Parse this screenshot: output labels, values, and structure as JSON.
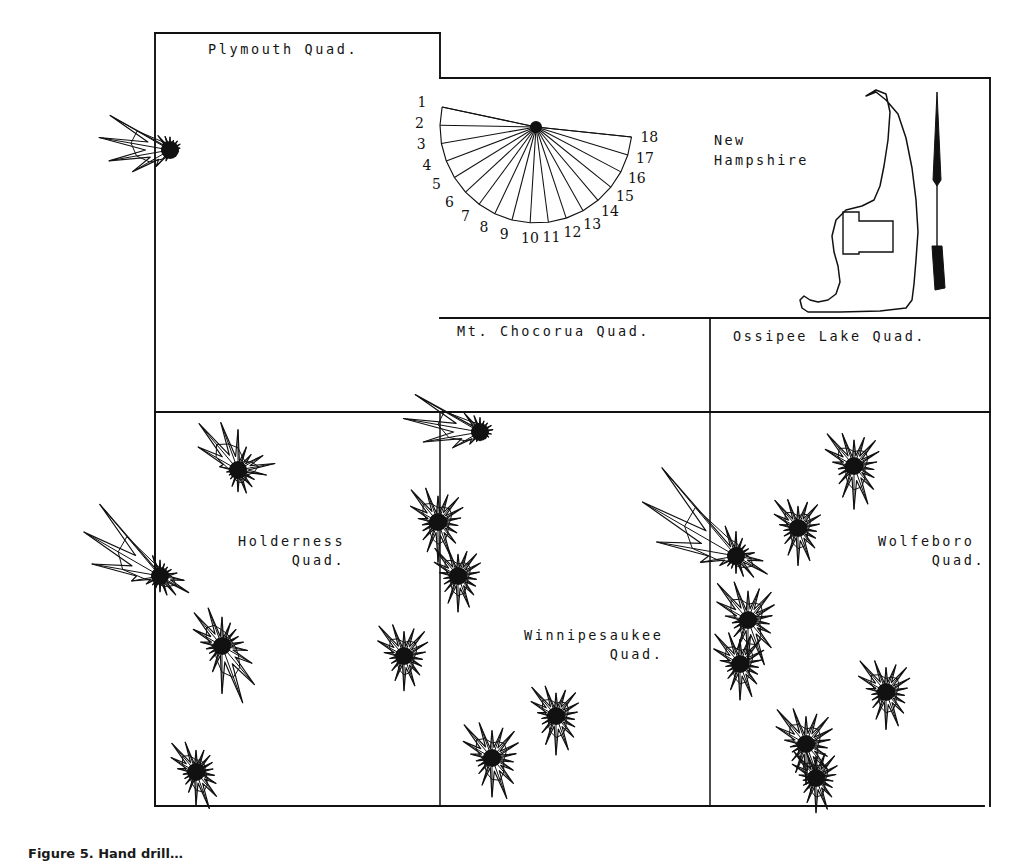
{
  "figure": {
    "caption": "Figure 5.  Hand drill…",
    "background": "#ffffff",
    "ink": "#111111"
  },
  "inset": {
    "title_line1": "New",
    "title_line2": "Hampshire",
    "state_name": "New Hampshire",
    "study_area_box": "rectangular outline inside state",
    "north_arrow": "north-arrow"
  },
  "legend": {
    "ray_labels": [
      "1",
      "2",
      "3",
      "4",
      "5",
      "6",
      "7",
      "8",
      "9",
      "10",
      "11",
      "12",
      "13",
      "14",
      "15",
      "16",
      "17",
      "18"
    ],
    "ray_count": 18
  },
  "quads": [
    {
      "id": "plymouth",
      "label_lines": [
        "Plymouth Quad."
      ]
    },
    {
      "id": "mt-chocorua",
      "label_lines": [
        "Mt. Chocorua Quad."
      ]
    },
    {
      "id": "ossipee-lake",
      "label_lines": [
        "Ossipee Lake Quad."
      ]
    },
    {
      "id": "holderness",
      "label_lines": [
        "Holderness",
        "     Quad."
      ]
    },
    {
      "id": "winnipesaukee",
      "label_lines": [
        "Winnipesaukee",
        "        Quad."
      ]
    },
    {
      "id": "wolfeboro",
      "label_lines": [
        "Wolfeboro",
        "     Quad."
      ]
    }
  ],
  "chart_data": {
    "type": "rose",
    "ray_count": 18,
    "ray_labels": [
      "1",
      "2",
      "3",
      "4",
      "5",
      "6",
      "7",
      "8",
      "9",
      "10",
      "11",
      "12",
      "13",
      "14",
      "15",
      "16",
      "17",
      "18"
    ],
    "legend_rose": {
      "cx": 536,
      "cy": 127,
      "start_deg": 168,
      "sweep_deg": 186,
      "radius": 96,
      "values": [
        96,
        96,
        96,
        96,
        96,
        96,
        96,
        96,
        96,
        96,
        96,
        96,
        96,
        96,
        96,
        96,
        96,
        96
      ]
    },
    "roses": [
      {
        "id": "r1",
        "quad": "plymouth",
        "cx": 170,
        "cy": 150,
        "scale": 1.0,
        "values": [
          18,
          20,
          26,
          96,
          100,
          86,
          60,
          30,
          16,
          10,
          8,
          8,
          10,
          12,
          14,
          16,
          16,
          14
        ]
      },
      {
        "id": "r2",
        "quad": "holderness",
        "cx": 238,
        "cy": 470,
        "scale": 1.0,
        "values": [
          56,
          70,
          84,
          64,
          26,
          16,
          14,
          16,
          24,
          30,
          34,
          30,
          26,
          40,
          52,
          40,
          28,
          34
        ]
      },
      {
        "id": "r3",
        "quad": "holderness",
        "cx": 160,
        "cy": 576,
        "scale": 1.0,
        "values": [
          22,
          30,
          130,
          122,
          96,
          40,
          22,
          16,
          18,
          22,
          28,
          34,
          46,
          34,
          24,
          18,
          16,
          18
        ]
      },
      {
        "id": "r4",
        "quad": "holderness",
        "cx": 222,
        "cy": 646,
        "scale": 1.0,
        "values": [
          40,
          56,
          60,
          46,
          30,
          22,
          20,
          26,
          38,
          66,
          84,
          70,
          48,
          36,
          30,
          26,
          30,
          34
        ]
      },
      {
        "id": "r5",
        "quad": "holderness",
        "cx": 196,
        "cy": 772,
        "scale": 1.0,
        "values": [
          30,
          44,
          52,
          40,
          26,
          18,
          18,
          22,
          30,
          46,
          54,
          44,
          32,
          26,
          24,
          26,
          30,
          32
        ]
      },
      {
        "id": "r6",
        "quad": "mt-chocorua",
        "cx": 480,
        "cy": 432,
        "scale": 1.0,
        "values": [
          20,
          24,
          34,
          104,
          108,
          80,
          44,
          22,
          14,
          12,
          10,
          12,
          14,
          16,
          18,
          18,
          16,
          16
        ]
      },
      {
        "id": "r7",
        "quad": "mt-chocorua",
        "cx": 438,
        "cy": 522,
        "scale": 1.0,
        "values": [
          36,
          50,
          58,
          44,
          28,
          22,
          24,
          32,
          44,
          56,
          50,
          38,
          30,
          28,
          32,
          40,
          44,
          40
        ]
      },
      {
        "id": "r8",
        "quad": "mt-chocorua",
        "cx": 458,
        "cy": 576,
        "scale": 1.0,
        "values": [
          30,
          42,
          50,
          38,
          26,
          20,
          22,
          28,
          40,
          50,
          46,
          34,
          28,
          26,
          30,
          36,
          40,
          36
        ]
      },
      {
        "id": "r9",
        "quad": "mt-chocorua",
        "cx": 404,
        "cy": 656,
        "scale": 1.0,
        "values": [
          34,
          46,
          54,
          42,
          28,
          20,
          20,
          26,
          36,
          48,
          44,
          34,
          28,
          26,
          30,
          38,
          44,
          40
        ]
      },
      {
        "id": "r10",
        "quad": "mt-chocorua",
        "cx": 492,
        "cy": 758,
        "scale": 1.0,
        "values": [
          38,
          52,
          60,
          46,
          30,
          22,
          22,
          28,
          40,
          54,
          60,
          46,
          34,
          30,
          34,
          42,
          48,
          44
        ]
      },
      {
        "id": "r11",
        "quad": "winnipesaukee",
        "cx": 556,
        "cy": 716,
        "scale": 1.0,
        "values": [
          32,
          44,
          52,
          40,
          26,
          20,
          22,
          30,
          42,
          54,
          50,
          38,
          30,
          26,
          30,
          36,
          42,
          38
        ]
      },
      {
        "id": "r12",
        "quad": "winnipesaukee",
        "cx": 736,
        "cy": 556,
        "scale": 1.0,
        "values": [
          34,
          44,
          160,
          150,
          112,
          50,
          26,
          18,
          18,
          24,
          30,
          38,
          50,
          38,
          26,
          20,
          20,
          26
        ]
      },
      {
        "id": "r13",
        "quad": "winnipesaukee",
        "cx": 748,
        "cy": 620,
        "scale": 1.0,
        "values": [
          40,
          56,
          66,
          50,
          32,
          22,
          22,
          30,
          44,
          60,
          66,
          50,
          36,
          30,
          34,
          42,
          50,
          46
        ]
      },
      {
        "id": "r14",
        "quad": "winnipesaukee",
        "cx": 740,
        "cy": 664,
        "scale": 1.0,
        "values": [
          34,
          46,
          54,
          42,
          28,
          20,
          20,
          26,
          38,
          50,
          48,
          36,
          28,
          26,
          30,
          38,
          44,
          40
        ]
      },
      {
        "id": "r15",
        "quad": "wolfeboro",
        "cx": 854,
        "cy": 466,
        "scale": 1.0,
        "values": [
          36,
          48,
          58,
          46,
          30,
          22,
          24,
          32,
          46,
          60,
          56,
          42,
          32,
          28,
          32,
          40,
          46,
          42
        ]
      },
      {
        "id": "r16",
        "quad": "wolfeboro",
        "cx": 798,
        "cy": 528,
        "scale": 1.0,
        "values": [
          30,
          42,
          50,
          38,
          26,
          20,
          22,
          28,
          40,
          52,
          48,
          36,
          28,
          26,
          30,
          36,
          42,
          38
        ]
      },
      {
        "id": "r17",
        "quad": "wolfeboro",
        "cx": 886,
        "cy": 692,
        "scale": 1.0,
        "values": [
          34,
          46,
          56,
          44,
          28,
          20,
          22,
          28,
          40,
          52,
          50,
          38,
          30,
          26,
          30,
          38,
          44,
          40
        ]
      },
      {
        "id": "r18",
        "quad": "wolfeboro",
        "cx": 806,
        "cy": 744,
        "scale": 1.0,
        "values": [
          38,
          52,
          62,
          48,
          30,
          22,
          22,
          30,
          42,
          56,
          60,
          46,
          34,
          30,
          34,
          42,
          48,
          44
        ]
      },
      {
        "id": "r19",
        "quad": "wolfeboro",
        "cx": 816,
        "cy": 778,
        "scale": 1.0,
        "values": [
          30,
          40,
          48,
          38,
          24,
          18,
          20,
          26,
          36,
          48,
          46,
          34,
          26,
          24,
          28,
          34,
          40,
          36
        ]
      }
    ]
  }
}
